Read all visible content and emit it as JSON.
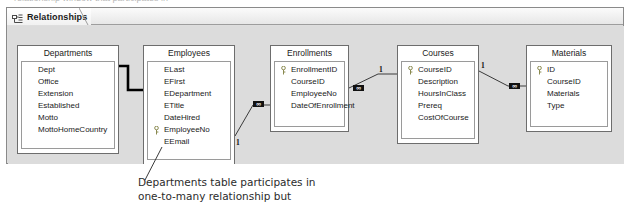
{
  "top_cut_text": "relationship window that participates in",
  "tab": {
    "label": "Relationships",
    "icon": "relationships-icon"
  },
  "canvas": {
    "tables": [
      {
        "name": "Departments",
        "fields": [
          {
            "label": "Dept",
            "key": false
          },
          {
            "label": "Office",
            "key": false
          },
          {
            "label": "Extension",
            "key": false
          },
          {
            "label": "Established",
            "key": false
          },
          {
            "label": "Motto",
            "key": false
          },
          {
            "label": "MottoHomeCountry",
            "key": false
          }
        ]
      },
      {
        "name": "Employees",
        "fields": [
          {
            "label": "ELast",
            "key": false
          },
          {
            "label": "EFirst",
            "key": false
          },
          {
            "label": "EDepartment",
            "key": false
          },
          {
            "label": "ETitle",
            "key": false
          },
          {
            "label": "DateHired",
            "key": false
          },
          {
            "label": "EmployeeNo",
            "key": true
          },
          {
            "label": "EEmail",
            "key": false
          }
        ]
      },
      {
        "name": "Enrollments",
        "fields": [
          {
            "label": "EnrollmentID",
            "key": true
          },
          {
            "label": "CourseID",
            "key": false
          },
          {
            "label": "EmployeeNo",
            "key": false
          },
          {
            "label": "DateOfEnrollment",
            "key": false
          }
        ]
      },
      {
        "name": "Courses",
        "fields": [
          {
            "label": "CourseID",
            "key": true
          },
          {
            "label": "Description",
            "key": false
          },
          {
            "label": "HoursInClass",
            "key": false
          },
          {
            "label": "Prereq",
            "key": false
          },
          {
            "label": "CostOfCourse",
            "key": false
          }
        ]
      },
      {
        "name": "Materials",
        "fields": [
          {
            "label": "ID",
            "key": true
          },
          {
            "label": "CourseID",
            "key": false
          },
          {
            "label": "Materials",
            "key": false
          },
          {
            "label": "Type",
            "key": false
          }
        ]
      }
    ],
    "cardinality_markers": [
      {
        "id": "emp-one",
        "text": "1"
      },
      {
        "id": "enr-many",
        "text": "∞"
      },
      {
        "id": "enr-many2",
        "text": "∞"
      },
      {
        "id": "crs-one",
        "text": "1"
      },
      {
        "id": "crs-one2",
        "text": "1"
      },
      {
        "id": "mat-many",
        "text": "∞"
      }
    ]
  },
  "annotation": {
    "line1": "Departments table participates in",
    "line2": "one-to-many relationship but"
  },
  "colors": {
    "canvas_bg": "#dcdcdc",
    "table_bg": "#ffffff",
    "border": "#6d6d6d",
    "connector": "#3a3a3a",
    "thick_connector": "#000000",
    "annotation_text": "#2b2b2b"
  }
}
